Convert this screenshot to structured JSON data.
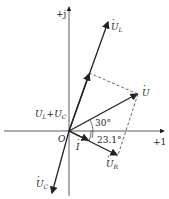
{
  "diagram": {
    "type": "phasor-diagram",
    "axes": {
      "real_label": "+1",
      "imag_label": "+j",
      "origin_label": "O"
    },
    "phasors": [
      {
        "name": "U_L",
        "label_main": "U",
        "label_sub": "L",
        "dot": "·"
      },
      {
        "name": "U",
        "label_main": "U",
        "label_sub": "",
        "dot": "·"
      },
      {
        "name": "U_R",
        "label_main": "U",
        "label_sub": "R",
        "dot": "·"
      },
      {
        "name": "U_C",
        "label_main": "U",
        "label_sub": "C",
        "dot": "·"
      },
      {
        "name": "I",
        "label_main": "I",
        "label_sub": "",
        "dot": "·"
      },
      {
        "name": "U_L+U_C",
        "label_main": "U",
        "label_sub": "L",
        "plus": "+",
        "label_main2": "U",
        "label_sub2": "C",
        "dot": "·"
      }
    ],
    "angles": [
      {
        "label": "30°",
        "between": "I and U"
      },
      {
        "label": "23.1°",
        "between": "+1 axis and I"
      }
    ],
    "colors": {
      "line": "#222222",
      "dashed": "#444444"
    }
  }
}
